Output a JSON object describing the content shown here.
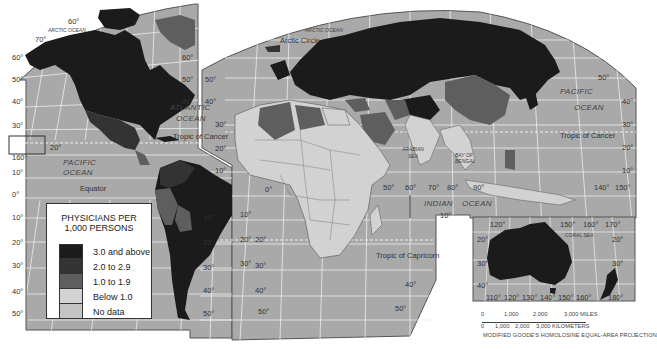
{
  "legend": {
    "title_line1": "PHYSICIANS PER",
    "title_line2": "1,000 PERSONS",
    "items": [
      {
        "label": "3.0 and above",
        "color": "#1b1b1b"
      },
      {
        "label": "2.0 to 2.9",
        "color": "#333333"
      },
      {
        "label": "1.0 to 1.9",
        "color": "#5e5e5e"
      },
      {
        "label": "Below 1.0",
        "color": "#d2d2d2"
      },
      {
        "label": "No data",
        "color": "#c4c4c4"
      }
    ]
  },
  "colors": {
    "ocean": "#a9a9a9",
    "graticule": "#eeeeee",
    "border": "#555555",
    "background": "#ffffff"
  },
  "ocean_labels": {
    "arctic_west": "ARCTIC OCEAN",
    "arctic_east": "ARCTIC OCEAN",
    "atlantic_1": "ATLANTIC",
    "atlantic_2": "OCEAN",
    "pacific_west_1": "PACIFIC",
    "pacific_west_2": "OCEAN",
    "pacific_east_1": "PACIFIC",
    "pacific_east_2": "OCEAN",
    "indian": "INDIAN",
    "indian_ocean": "OCEAN",
    "arabian_sea_1": "ARABIAN",
    "arabian_sea_2": "SEA",
    "bay_of_bengal_1": "BAY OF",
    "bay_of_bengal_2": "BENGAL",
    "coral_sea": "CORAL SEA"
  },
  "reference_lines": {
    "arctic_circle": "Arctic Circle",
    "tropic_of_cancer_west": "Tropic of Cancer",
    "tropic_of_cancer_east": "Tropic of Cancer",
    "equator": "Equator",
    "tropic_of_capricorn": "Tropic of Capricorn"
  },
  "lat_labels": {
    "w60t": "60°",
    "w70t": "70°",
    "w60": "60°",
    "w50": "50°",
    "w40": "40°",
    "w30": "30°",
    "w20": "20°",
    "w160": "160°",
    "w10": "10°",
    "w0": "0°",
    "w10s": "10°",
    "w20s": "20°",
    "w30s": "30°",
    "w40s": "40°",
    "w50s": "50°",
    "a30": "30°",
    "a20": "20°",
    "a10": "10°",
    "sa20": "20°",
    "sa30": "30°",
    "sa40": "40°",
    "sa50": "50°",
    "e60": "60°",
    "e50": "50°",
    "e40a": "40°",
    "e40b": "40°",
    "e50b": "50°",
    "e0": "0°",
    "e10s": "10°",
    "e20s": "20°",
    "e30s": "30°",
    "e40s": "40°",
    "e50s": "50°",
    "af10": "10°",
    "af20": "20°",
    "af30": "30°",
    "af40": "40°",
    "af50": "50°",
    "lon50": "50°",
    "lon60": "60°",
    "lon70": "70°",
    "lon80": "80°",
    "lon90": "90°",
    "lon140": "140°",
    "lon150": "150°",
    "ind10s": "10°",
    "pe50": "50°",
    "pe40": "40°",
    "pe30": "30°",
    "pe20": "20°",
    "pe10": "10°",
    "au120": "120°",
    "au150": "150°",
    "au160": "160°",
    "au170": "170°",
    "au20": "20°",
    "au20e": "20°",
    "au30": "30°",
    "au30e": "30°",
    "au40": "40°",
    "aub110": "110°",
    "aub120": "120°",
    "aub130": "130°",
    "aub140": "140°",
    "aub150": "150°",
    "aub160": "160°",
    "aub180": "180°"
  },
  "scale": {
    "miles": [
      "0",
      "1,000",
      "2,000",
      "3,000 MILES"
    ],
    "km": [
      "0",
      "1,000",
      "2,000",
      "3,000 KILOMETERS"
    ]
  },
  "projection": "MODIFIED GOODE'S HOMOLOSINE EQUAL-AREA PROJECTION"
}
